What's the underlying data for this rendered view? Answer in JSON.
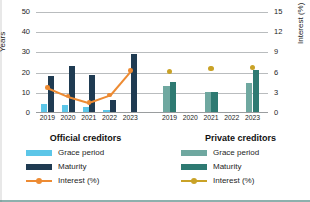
{
  "chart_data": {
    "type": "bar",
    "title": "",
    "xlabel": "",
    "ylabel": "Years",
    "y2label": "Interest (%)",
    "ylim": [
      0,
      50
    ],
    "y2lim": [
      0,
      15
    ],
    "grid": true,
    "legend_position": "bottom",
    "categories": [
      "2019",
      "2020",
      "2021",
      "2022",
      "2023"
    ],
    "y_ticks": [
      "0",
      "10",
      "20",
      "30",
      "40",
      "50"
    ],
    "y2_ticks": [
      "0",
      "3",
      "6",
      "9",
      "12",
      "15"
    ],
    "groups": [
      {
        "name": "Official creditors",
        "series": [
          {
            "name": "Grace period",
            "axis": "left",
            "kind": "bar",
            "color": "#5CC6E8",
            "values": [
              4.7,
              3.9,
              3.2,
              1.6,
              0.6
            ]
          },
          {
            "name": "Maturity",
            "axis": "left",
            "kind": "bar",
            "color": "#1F3B52",
            "values": [
              18.3,
              23.1,
              18.8,
              6.6,
              29.4
            ]
          },
          {
            "name": "Interest (%)",
            "axis": "right",
            "kind": "line",
            "color": "#ED8B33",
            "values": [
              3.8,
              2.5,
              1.6,
              2.7,
              6.3
            ]
          }
        ]
      },
      {
        "name": "Private creditors",
        "series": [
          {
            "name": "Grace period",
            "axis": "left",
            "kind": "bar",
            "color": "#6FA8A0",
            "values": [
              13.6,
              null,
              10.4,
              null,
              15.0
            ]
          },
          {
            "name": "Maturity",
            "axis": "left",
            "kind": "bar",
            "color": "#2E7A72",
            "values": [
              15.2,
              null,
              10.4,
              null,
              21.1
            ]
          },
          {
            "name": "Interest (%)",
            "axis": "right",
            "kind": "line",
            "color": "#C9A227",
            "values": [
              6.2,
              null,
              6.6,
              null,
              6.8
            ]
          }
        ]
      }
    ]
  },
  "axes": {
    "left_title": "Years",
    "right_title": "Interest (%)",
    "left_ticks": [
      "50",
      "40",
      "30",
      "20",
      "10",
      "0"
    ],
    "right_ticks": [
      "15",
      "12",
      "9",
      "6",
      "3",
      "0"
    ]
  },
  "xaxis": {
    "official_years": [
      "2019",
      "2020",
      "2021",
      "2022",
      "2023"
    ],
    "private_years": [
      "2019",
      "2020",
      "2021",
      "2022",
      "2023"
    ]
  },
  "legend": {
    "official": {
      "title": "Official creditors",
      "grace_label": "Grace period",
      "maturity_label": "Maturity",
      "interest_label": "Interest (%)",
      "grace_color": "#5CC6E8",
      "maturity_color": "#1F3B52",
      "interest_color": "#ED8B33"
    },
    "private": {
      "title": "Private creditors",
      "grace_label": "Grace period",
      "maturity_label": "Maturity",
      "interest_label": "Interest (%)",
      "grace_color": "#6FA8A0",
      "maturity_color": "#2E7A72",
      "interest_color": "#C9A227"
    }
  }
}
